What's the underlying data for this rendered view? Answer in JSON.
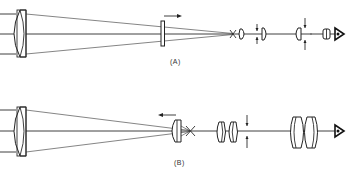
{
  "figure": {
    "panels": [
      {
        "id": "A",
        "label": "(A)",
        "description": "Telescope optical train with movable field element shifted right; rays converge to focal point, followed by eyepiece elements with adjustable positions and eye at right",
        "motion_arrow": "right",
        "components": [
          "objective-lens",
          "movable-plate-lens",
          "focal-point",
          "field-lens",
          "relay-lens-1",
          "relay-lens-2",
          "eye-lens-doublet",
          "eye"
        ]
      },
      {
        "id": "B",
        "label": "(B)",
        "description": "Telescope optical train with movable lens shifted left; rays converge to focal point, followed by doublet relay lenses, aperture stop arrows and large eyepiece doublet with eye at right",
        "motion_arrow": "left",
        "components": [
          "objective-lens",
          "movable-lens",
          "focal-point",
          "relay-doublet",
          "stop",
          "eyepiece-doublet",
          "eye"
        ]
      }
    ],
    "colors": {
      "line": "#2a2a2a",
      "background": "#ffffff"
    }
  }
}
